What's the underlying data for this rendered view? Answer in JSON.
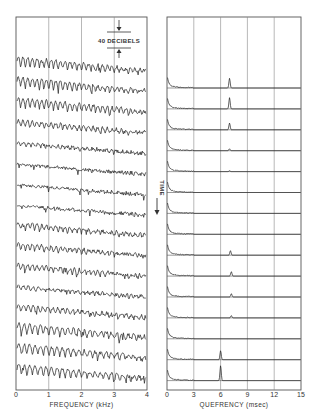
{
  "figure": {
    "left_panel": {
      "xlabel": "FREQUENCY (kHz)",
      "x_ticks": [
        "0",
        "1",
        "2",
        "3",
        "4"
      ],
      "scale_bar_label": "40 DECIBELS"
    },
    "right_panel": {
      "xlabel": "QUEFRENCY (msec)",
      "x_ticks": [
        "0",
        "3",
        "6",
        "9",
        "12",
        "15"
      ],
      "time_label": "TIME"
    }
  },
  "chart_data": [
    {
      "type": "line",
      "title": "",
      "xlabel": "FREQUENCY (kHz)",
      "ylabel": "",
      "xlim": [
        0,
        4
      ],
      "x_ticks": [
        0,
        1,
        2,
        3,
        4
      ],
      "grid": "vertical at 1, 2, 3 kHz",
      "annotations": [
        "40 DECIBELS scale bar"
      ],
      "description": "Stacked log-magnitude spectra (waterfall), time increasing downward",
      "n_traces": 16,
      "series": [
        {
          "name": "trace 1",
          "harmonic_ripple": "strong",
          "period_hz": 143
        },
        {
          "name": "trace 2",
          "harmonic_ripple": "strong",
          "period_hz": 143
        },
        {
          "name": "trace 3",
          "harmonic_ripple": "strong",
          "period_hz": 143
        },
        {
          "name": "trace 4",
          "harmonic_ripple": "moderate",
          "period_hz": 143
        },
        {
          "name": "trace 5",
          "harmonic_ripple": "weak"
        },
        {
          "name": "trace 6",
          "harmonic_ripple": "none"
        },
        {
          "name": "trace 7",
          "harmonic_ripple": "none"
        },
        {
          "name": "trace 8",
          "harmonic_ripple": "none"
        },
        {
          "name": "trace 9",
          "harmonic_ripple": "moderate",
          "period_hz": 143
        },
        {
          "name": "trace 10",
          "harmonic_ripple": "moderate",
          "period_hz": 143
        },
        {
          "name": "trace 11",
          "harmonic_ripple": "moderate",
          "period_hz": 143
        },
        {
          "name": "trace 12",
          "harmonic_ripple": "weak"
        },
        {
          "name": "trace 13",
          "harmonic_ripple": "moderate"
        },
        {
          "name": "trace 14",
          "harmonic_ripple": "strong",
          "period_hz": 167
        },
        {
          "name": "trace 15",
          "harmonic_ripple": "strong",
          "period_hz": 167
        },
        {
          "name": "trace 16",
          "harmonic_ripple": "strong",
          "period_hz": 167
        }
      ]
    },
    {
      "type": "line",
      "title": "",
      "xlabel": "QUEFRENCY (msec)",
      "ylabel": "TIME (increasing downward)",
      "xlim": [
        0,
        15
      ],
      "x_ticks": [
        0,
        3,
        6,
        9,
        12,
        15
      ],
      "grid": "vertical at 3, 6, 9, 12 msec; horizontal baselines per trace",
      "description": "Stacked cepstra; pitch peak position per trace",
      "n_traces": 15,
      "series": [
        {
          "name": "trace 1",
          "peak_quefrency_ms": 7.0,
          "peak_height": 0.65
        },
        {
          "name": "trace 2",
          "peak_quefrency_ms": 7.0,
          "peak_height": 0.75
        },
        {
          "name": "trace 3",
          "peak_quefrency_ms": 7.0,
          "peak_height": 0.45
        },
        {
          "name": "trace 4",
          "peak_quefrency_ms": 7.0,
          "peak_height": 0.12
        },
        {
          "name": "trace 5",
          "peak_quefrency_ms": 7.0,
          "peak_height": 0.06
        },
        {
          "name": "trace 6",
          "peak_quefrency_ms": null,
          "peak_height": 0
        },
        {
          "name": "trace 7",
          "peak_quefrency_ms": null,
          "peak_height": 0
        },
        {
          "name": "trace 8",
          "peak_quefrency_ms": null,
          "peak_height": 0
        },
        {
          "name": "trace 9",
          "peak_quefrency_ms": 7.1,
          "peak_height": 0.3
        },
        {
          "name": "trace 10",
          "peak_quefrency_ms": 7.2,
          "peak_height": 0.3
        },
        {
          "name": "trace 11",
          "peak_quefrency_ms": 7.2,
          "peak_height": 0.22
        },
        {
          "name": "trace 12",
          "peak_quefrency_ms": 7.2,
          "peak_height": 0.15
        },
        {
          "name": "trace 13",
          "peak_quefrency_ms": null,
          "peak_height": 0
        },
        {
          "name": "trace 14",
          "peak_quefrency_ms": 6.0,
          "peak_height": 0.6
        },
        {
          "name": "trace 15",
          "peak_quefrency_ms": 6.0,
          "peak_height": 1.0
        }
      ]
    }
  ]
}
